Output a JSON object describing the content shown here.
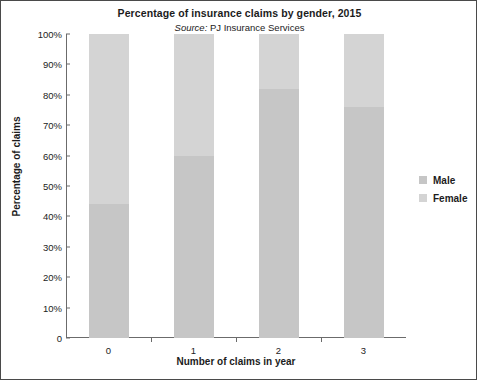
{
  "chart_data": {
    "type": "bar",
    "stacked": true,
    "stack_total": 100,
    "title": "Percentage of insurance claims by gender, 2015",
    "subtitle_prefix": "Source:",
    "subtitle_text": "PJ Insurance Services",
    "xlabel": "Number of claims in year",
    "ylabel": "Percentage of claims",
    "categories": [
      "0",
      "1",
      "2",
      "3"
    ],
    "ylim": [
      0,
      100
    ],
    "yticks": [
      0,
      10,
      20,
      30,
      40,
      50,
      60,
      70,
      80,
      90,
      100
    ],
    "ytick_labels": [
      "0",
      "10%",
      "20%",
      "30%",
      "40%",
      "50%",
      "60%",
      "70%",
      "80%",
      "90%",
      "100%"
    ],
    "grid": false,
    "legend_position": "right",
    "series": [
      {
        "name": "Male",
        "color": "#c6c6c6",
        "values": [
          44,
          60,
          82,
          76
        ]
      },
      {
        "name": "Female",
        "color": "#d4d4d4",
        "values": [
          56,
          40,
          18,
          24
        ]
      }
    ]
  },
  "legend": {
    "items": [
      {
        "label": "Male",
        "color": "#c6c6c6"
      },
      {
        "label": "Female",
        "color": "#d4d4d4"
      }
    ]
  },
  "colors": {
    "axis": "#6b6b6b",
    "text": "#1c1c1c",
    "background": "#ffffff",
    "border": "#4a4a4a"
  }
}
